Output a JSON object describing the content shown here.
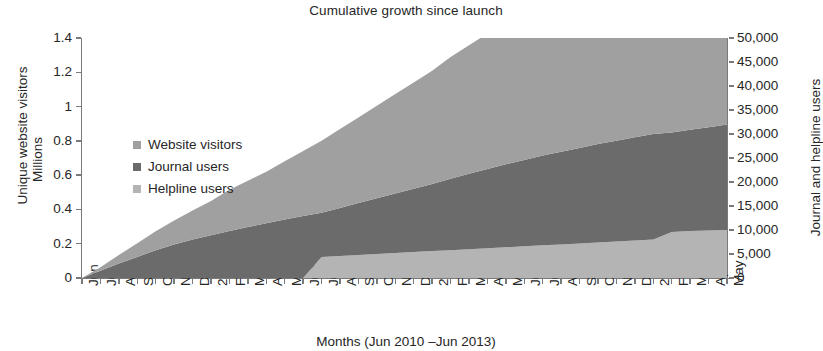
{
  "chart_data": {
    "type": "area",
    "stacked": true,
    "title": "Cumulative growth since launch",
    "xlabel": "Months (Jun 2010 –Jun 2013)",
    "ylabel_left_primary": "Unique website visitors",
    "ylabel_left_secondary": "Millions",
    "ylabel_right": "Journal and helpline users",
    "grid": false,
    "legend_position": "inside-upper-left",
    "ylim_left": [
      0,
      1.4
    ],
    "ytick_labels_left": [
      "0",
      "0.2",
      "0.4",
      "0.6",
      "0.8",
      "1",
      "1.2",
      "1.4"
    ],
    "ytick_values_left": [
      0,
      0.2,
      0.4,
      0.6,
      0.8,
      1,
      1.2,
      1.4
    ],
    "ylim_right": [
      0,
      50000
    ],
    "ytick_labels_right": [
      "0",
      "5,000",
      "10,000",
      "15,000",
      "20,000",
      "25,000",
      "30,000",
      "35,000",
      "40,000",
      "45,000",
      "50,000"
    ],
    "ytick_values_right": [
      0,
      5000,
      10000,
      15000,
      20000,
      25000,
      30000,
      35000,
      40000,
      45000,
      50000
    ],
    "categories": [
      "Jun",
      "Jul",
      "Aug",
      "Sep",
      "Oct",
      "Nov",
      "Dec",
      "2011",
      "Feb",
      "Mar",
      "Apr",
      "May",
      "Jun",
      "Jul",
      "Aug",
      "Sep",
      "Oct",
      "Nov",
      "Dec",
      "2012",
      "Feb",
      "Mar",
      "Apr",
      "May",
      "Jun",
      "Jul",
      "Aug",
      "Sep",
      "Oct",
      "Nov",
      "Dec",
      "2013",
      "Feb",
      "Mar",
      "Apr",
      "May"
    ],
    "series": [
      {
        "name": "Helpline users",
        "color": "#b4b4b4",
        "unit": "users",
        "axis": "right",
        "values": [
          0,
          0,
          0,
          0,
          0,
          0,
          0,
          0,
          0,
          0,
          0,
          0,
          0,
          4400,
          4600,
          4800,
          5000,
          5200,
          5400,
          5600,
          5800,
          6000,
          6200,
          6400,
          6600,
          6800,
          7000,
          7200,
          7400,
          7600,
          7800,
          8000,
          9600,
          9800,
          9900,
          10000
        ]
      },
      {
        "name": "Journal users",
        "color": "#6b6b6b",
        "unit": "users",
        "axis": "right",
        "values": [
          0,
          1500,
          3000,
          4400,
          5800,
          7000,
          8000,
          8900,
          9800,
          10600,
          11400,
          12200,
          12900,
          9200,
          10000,
          10800,
          11600,
          12400,
          13200,
          14000,
          14900,
          15700,
          16500,
          17300,
          18000,
          18700,
          19300,
          19900,
          20500,
          21000,
          21500,
          22000,
          20700,
          21100,
          21500,
          22000
        ]
      },
      {
        "name": "Website visitors",
        "color": "#a0a0a0",
        "unit": "millions",
        "axis": "left",
        "values": [
          0,
          0.02,
          0.05,
          0.08,
          0.11,
          0.14,
          0.17,
          0.2,
          0.24,
          0.27,
          0.3,
          0.34,
          0.38,
          0.42,
          0.46,
          0.5,
          0.54,
          0.58,
          0.62,
          0.66,
          0.71,
          0.75,
          0.79,
          0.84,
          0.88,
          0.93,
          0.97,
          1.01,
          1.05,
          1.09,
          1.13,
          1.17,
          1.21,
          1.24,
          1.26,
          1.28
        ]
      }
    ]
  },
  "legend": {
    "items": [
      {
        "label": "Website visitors",
        "color": "#a0a0a0"
      },
      {
        "label": "Journal users",
        "color": "#6b6b6b"
      },
      {
        "label": "Helpline users",
        "color": "#b4b4b4"
      }
    ]
  }
}
